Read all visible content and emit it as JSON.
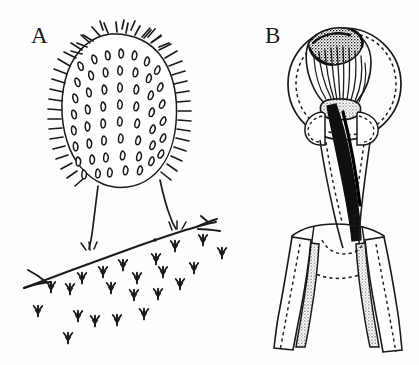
{
  "figure": {
    "background_color": "#fdfdfd",
    "ink_color": "#1a1a1a",
    "stipple_color": "#8a8a8a",
    "width": 419,
    "height": 365,
    "style": "pen-and-ink line drawing"
  },
  "panels": [
    {
      "id": "A",
      "label": "A",
      "label_x": 31,
      "label_y": 24,
      "subject": "colonial hydroid polyp with tentacle-covered club-shaped body on two stalks arising from a creeping stolon",
      "parts": [
        {
          "name": "polyp-body",
          "description": "ovoid club-shaped body densely covered with short teardrop tentacles arranged in vertical rows"
        },
        {
          "name": "tentacle-rows",
          "description": "roughly eight longitudinal rows of short comma-shaped tentacles"
        },
        {
          "name": "marginal-hatching",
          "description": "dense short hatch strokes outlining the left and right margins of the body"
        },
        {
          "name": "stalk-left",
          "description": "slender pedicel descending from body to stolon"
        },
        {
          "name": "stalk-right",
          "description": "slender pedicel descending from body to stolon"
        },
        {
          "name": "stolon",
          "description": "creeping horizontal runner line sloping down to the left"
        },
        {
          "name": "substrate-marks",
          "description": "scattered small trident/bird-track arrow marks below the stolon indicating substrate texture"
        }
      ],
      "substrate_mark_count": 22
    },
    {
      "id": "B",
      "label": "B",
      "label_x": 265,
      "label_y": 24,
      "subject": "detail of polyp head and hypostome with enveloping circular outline and bifurcating stolon branches",
      "parts": [
        {
          "name": "circular-outline",
          "description": "large circle drawn with paired solid and dashed outlines enclosing the head"
        },
        {
          "name": "stippled-mass",
          "description": "dark stippled granular mass at the upper left of the head"
        },
        {
          "name": "striated-tentacles",
          "description": "bundle of long parallel line-striated tentacles converging downward"
        },
        {
          "name": "constriction-neck",
          "description": "narrowed neck region where tentacles meet the column"
        },
        {
          "name": "dark-column-band",
          "description": "solid black band running down the centre of the column"
        },
        {
          "name": "branch-left",
          "description": "left downward-splaying branch with stippled inner band"
        },
        {
          "name": "branch-right",
          "description": "right downward-splaying branch with stippled inner band"
        },
        {
          "name": "dashed-perisarc",
          "description": "dashed inner outlines paralleling the solid branch walls"
        }
      ]
    }
  ]
}
